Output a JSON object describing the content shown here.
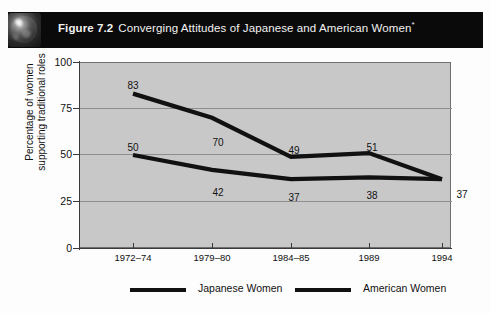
{
  "figure": {
    "icon": "globe-icon",
    "number_label": "Figure 7.2",
    "title": "Converging Attitudes of Japanese and American Women",
    "title_superscript": "*"
  },
  "axes": {
    "y_title_line1": "Percentage of women",
    "y_title_line2": "supporting traditional roles",
    "y_ticks": [
      "100",
      "75",
      "50",
      "25",
      "0"
    ],
    "x_ticks": [
      "1972–74",
      "1979–80",
      "1984–85",
      "1989",
      "1994"
    ]
  },
  "legend": {
    "items": [
      {
        "label": "Japanese Women",
        "color": "#111111"
      },
      {
        "label": "American Women",
        "color": "#111111"
      }
    ]
  },
  "labels": {
    "jp": [
      "83",
      "70",
      "49",
      "51",
      "37"
    ],
    "us": [
      "50",
      "42",
      "37",
      "38",
      "37"
    ]
  },
  "chart_data": {
    "type": "line",
    "title": "Converging Attitudes of Japanese and American Women*",
    "xlabel": "",
    "ylabel": "Percentage of women supporting traditional roles",
    "categories": [
      "1972–74",
      "1979–80",
      "1984–85",
      "1989",
      "1994"
    ],
    "series": [
      {
        "name": "Japanese Women",
        "values": [
          83,
          70,
          49,
          51,
          37
        ],
        "color": "#111111"
      },
      {
        "name": "American Women",
        "values": [
          50,
          42,
          37,
          38,
          37
        ],
        "color": "#111111"
      }
    ],
    "ylim": [
      0,
      100
    ],
    "yticks": [
      0,
      25,
      50,
      75,
      100
    ],
    "grid": true,
    "legend_position": "bottom",
    "data_labels": true
  }
}
